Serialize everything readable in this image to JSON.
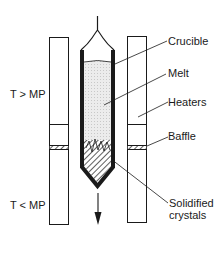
{
  "diagram": {
    "type": "Bridgman crystal growth setup",
    "labels": {
      "crucible": "Crucible",
      "melt": "Melt",
      "heaters": "Heaters",
      "baffle": "Baffle",
      "solidified_line1": "Solidified",
      "solidified_line2": "crystals",
      "hot_zone": "T > MP",
      "cold_zone": "T < MP"
    },
    "direction": "downward-arrow",
    "colors": {
      "line": "#1a1a1a",
      "melt_fill": "#e6e6e6",
      "background": "#ffffff"
    }
  }
}
